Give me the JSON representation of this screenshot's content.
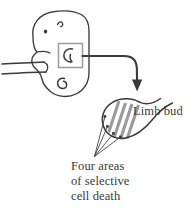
{
  "figure": {
    "type": "scientific-illustration",
    "background_color": "#ffffff",
    "ink_color": "#3a3a3a",
    "hatch_color": "#9a9a9a",
    "box_color": "#9b9b9b",
    "labels": {
      "limb_bud": "Limb bud",
      "caption_line_1": "Four areas",
      "caption_line_2": "of selective",
      "caption_line_3": "cell death"
    },
    "icons": {
      "embryo": "embryo-outline-icon",
      "eye": "embryo-eye-icon",
      "ear": "embryo-ear-icon",
      "forelimb": "forelimb-bud-icon",
      "hindlimb": "hindlimb-bud-icon",
      "callout_box": "callout-box-icon",
      "magnify_arrow": "curved-arrow-icon",
      "limb_bud_detail": "limb-bud-detail-icon",
      "death_zone_hatch": "selective-cell-death-hatch-icon",
      "leader_lines": "leader-lines-icon"
    },
    "counts": {
      "death_areas": 4,
      "leader_lines": 4
    }
  }
}
